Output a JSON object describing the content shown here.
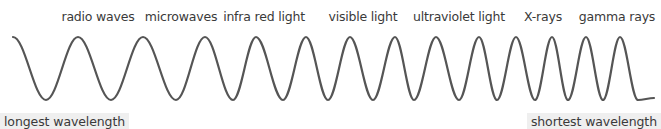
{
  "diagram": {
    "bands": [
      {
        "label": "radio waves",
        "x": 98
      },
      {
        "label": "microwaves",
        "x": 181
      },
      {
        "label": "infra red light",
        "x": 264
      },
      {
        "label": "visible light",
        "x": 363
      },
      {
        "label": "ultraviolet light",
        "x": 459
      },
      {
        "label": "X-rays",
        "x": 543
      },
      {
        "label": "gamma rays",
        "x": 617
      }
    ],
    "left_label": "longest wavelength",
    "right_label": "shortest wavelength",
    "wave": {
      "color": "#555555",
      "stroke_width": 2.2,
      "top_y": 37,
      "bottom_y": 100,
      "start": {
        "x": 13,
        "y": 37
      },
      "end": {
        "x": 654,
        "y": 98
      },
      "extrema_x": [
        46,
        78,
        111,
        143,
        176,
        205,
        233,
        256,
        283,
        306,
        328,
        350,
        373,
        395,
        414,
        436,
        459,
        479,
        497,
        516,
        535,
        552,
        568,
        586,
        603,
        620,
        638
      ],
      "first_extremum": "trough"
    }
  }
}
